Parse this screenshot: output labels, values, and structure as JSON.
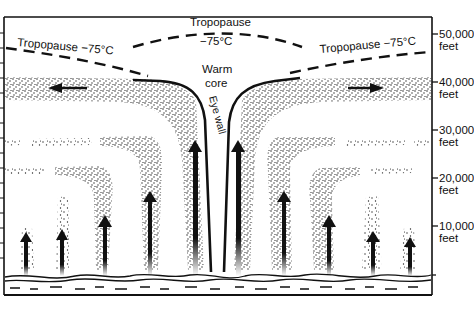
{
  "diagram": {
    "type": "hurricane-cross-section",
    "labels": {
      "tropopause_left": "Tropopause −75°C",
      "tropopause_center_title": "Tropopause",
      "tropopause_center_temp": "−75°C",
      "tropopause_right": "Tropopause −75°C",
      "warm_core_line1": "Warm",
      "warm_core_line2": "core",
      "eye_wall": "Eye wall"
    },
    "altitude_axis": [
      {
        "value": "50,000",
        "unit": "feet"
      },
      {
        "value": "40,000",
        "unit": "feet"
      },
      {
        "value": "30,000",
        "unit": "feet"
      },
      {
        "value": "20,000",
        "unit": "feet"
      },
      {
        "value": "10,000",
        "unit": "feet"
      }
    ],
    "colors": {
      "ink": "#111111",
      "background": "#ffffff",
      "stipple": "#222222"
    }
  }
}
